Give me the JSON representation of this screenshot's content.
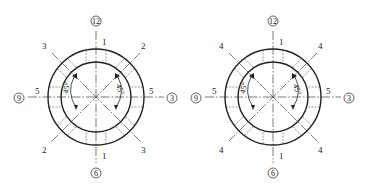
{
  "diagrams": [
    {
      "id": "left",
      "center": [
        96,
        97
      ],
      "outer_radius": 48,
      "inner_radius": 35,
      "clock_positions": {
        "top": "12",
        "right": "3",
        "bottom": "6",
        "left": "9"
      },
      "axis_labels": {
        "top": "1",
        "bottom": "1",
        "left": "5",
        "right": "5"
      },
      "diagonal_labels": {
        "top_left": "3",
        "top_right": "2",
        "bottom_left": "2",
        "bottom_right": "3"
      },
      "angle_labels": {
        "left": "45°",
        "right": "45°"
      }
    },
    {
      "id": "right",
      "center": [
        273,
        97
      ],
      "outer_radius": 48,
      "inner_radius": 35,
      "clock_positions": {
        "top": "12",
        "right": "3",
        "bottom": "6",
        "left": "9"
      },
      "axis_labels": {
        "top": "1",
        "bottom": "1",
        "left": "5",
        "right": "5"
      },
      "diagonal_labels": {
        "top_left": "4",
        "top_right": "4",
        "bottom_left": "4",
        "bottom_right": "4"
      },
      "angle_labels": {
        "left": "45°",
        "right": "45°"
      }
    }
  ],
  "colors": {
    "line": "#222222",
    "background": "#ffffff"
  }
}
